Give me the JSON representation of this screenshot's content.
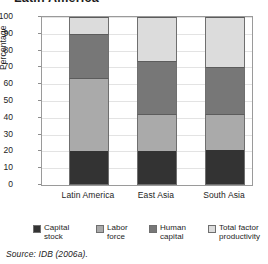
{
  "title": "Latin America",
  "source": "Source: IDB (2006a).",
  "chart_data": {
    "type": "bar",
    "subtype": "stacked-bar-100",
    "title": "Latin America",
    "xlabel": "",
    "ylabel": "Percentage",
    "ylim": [
      0,
      100
    ],
    "yticks": [
      0,
      10,
      20,
      30,
      40,
      50,
      60,
      70,
      80,
      90,
      100
    ],
    "grid": true,
    "legend_position": "bottom",
    "categories": [
      "Latin America",
      "East Asia",
      "South Asia"
    ],
    "series": [
      {
        "name": "Capital stock",
        "color": "#333333",
        "values": [
          20,
          20,
          21
        ]
      },
      {
        "name": "Labor force",
        "color": "#aaaaaa",
        "values": [
          44,
          22,
          21
        ]
      },
      {
        "name": "Human capital",
        "color": "#777777",
        "values": [
          26,
          32,
          28
        ]
      },
      {
        "name": "Total factor productivity",
        "color": "#dcdcdc",
        "values": [
          10,
          26,
          30
        ]
      }
    ],
    "cumulative_tops": {
      "Latin America": [
        20,
        64,
        90,
        100
      ],
      "East Asia": [
        20,
        42,
        74,
        100
      ],
      "South Asia": [
        21,
        42,
        70,
        100
      ]
    }
  },
  "yaxis": {
    "title": "Percentage",
    "ticks": [
      "100",
      "90",
      "80",
      "70",
      "60",
      "50",
      "40",
      "30",
      "20",
      "10",
      "0"
    ]
  },
  "xaxis": {
    "labels": [
      "Latin America",
      "East Asia",
      "South Asia"
    ]
  },
  "legend": {
    "items": [
      {
        "label": "Capital stock",
        "color": "#333333"
      },
      {
        "label": "Labor force",
        "color": "#aaaaaa"
      },
      {
        "label": "Human capital",
        "color": "#777777"
      },
      {
        "label": "Total factor productivity",
        "color": "#dcdcdc"
      }
    ]
  }
}
